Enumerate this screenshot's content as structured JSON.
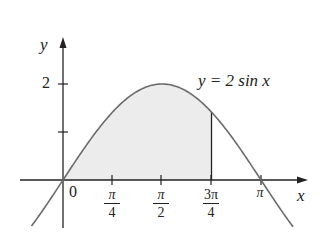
{
  "diagram": {
    "equation_label": "y = 2 sin x",
    "axes": {
      "x_label": "x",
      "y_label": "y",
      "origin_label": "0"
    },
    "y_ticks": [
      {
        "value": 1,
        "label": ""
      },
      {
        "value": 2,
        "label": "2"
      }
    ],
    "x_ticks": [
      {
        "value": "π/4",
        "numerator": "π",
        "denominator": "4"
      },
      {
        "value": "π/2",
        "numerator": "π",
        "denominator": "2"
      },
      {
        "value": "3π/4",
        "numerator": "3π",
        "denominator": "4"
      },
      {
        "value": "π",
        "numerator": "π",
        "denominator": ""
      }
    ],
    "shaded_region": {
      "from": "0",
      "to": "3π/4",
      "fill": "#ececec"
    },
    "colors": {
      "curve": "#6b6b6b",
      "axes": "#222222",
      "shade": "#ececec"
    }
  },
  "chart_data": {
    "type": "area",
    "function": "y = 2 sin x",
    "x_range": [
      -0.8,
      3.85
    ],
    "y_range": [
      -1.0,
      2.9
    ],
    "shaded_interval": [
      0,
      2.3562
    ],
    "x_ticks": [
      "π/4",
      "π/2",
      "3π/4",
      "π"
    ],
    "y_ticks": [
      1,
      2
    ],
    "xlabel": "x",
    "ylabel": "y",
    "annotation": "y = 2 sin x",
    "grid": false
  }
}
